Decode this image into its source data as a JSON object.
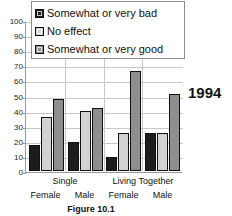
{
  "chart_data": {
    "type": "bar",
    "title": "",
    "caption": "Figure 10.1",
    "annotation": "1994",
    "xlabel": "",
    "ylabel": "",
    "ylim": [
      0,
      100
    ],
    "ytick_step": 10,
    "yticks": [
      "100",
      "90",
      "80",
      "70",
      "60",
      "50",
      "40",
      "30",
      "20",
      "10",
      "0"
    ],
    "grid": true,
    "legend_position": "top-center",
    "categories": [
      "Single Female",
      "Single Male",
      "Living Together Female",
      "Living Together Male"
    ],
    "group_labels": [
      "Single",
      "Living Together"
    ],
    "sub_labels": [
      "Female",
      "Male",
      "Female",
      "Male"
    ],
    "series": [
      {
        "name": "Somewhat or very bad",
        "color": "#1c1c1c",
        "values": [
          17,
          19,
          9,
          25
        ]
      },
      {
        "name": "No  effect",
        "color": "#d2d2d2",
        "values": [
          36,
          40,
          25,
          25
        ]
      },
      {
        "name": "Somewhat or very good",
        "color": "#8e8e8e",
        "values": [
          48,
          42,
          66,
          51
        ]
      }
    ]
  },
  "legend": {
    "items": [
      {
        "label": "Somewhat or very bad",
        "swatch": "#1c1c1c"
      },
      {
        "label": "No  effect",
        "swatch": "#d2d2d2"
      },
      {
        "label": "Somewhat or very good",
        "swatch": "#8e8e8e"
      }
    ]
  },
  "axes": {
    "y_max": 100,
    "y_min": 0
  }
}
